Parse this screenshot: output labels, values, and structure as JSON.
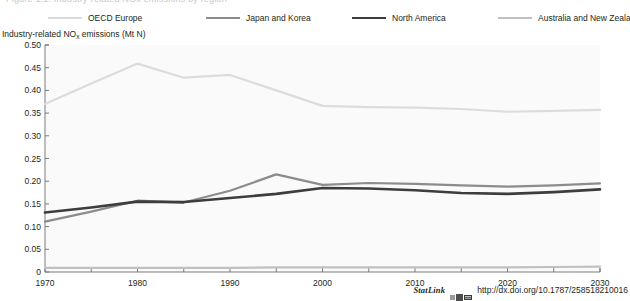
{
  "figure": {
    "cutoff_text": "Figure 1.1. Industry-related NOx emissions by region",
    "y_axis_title_main": "Industry-related NO",
    "y_axis_title_sub": "x",
    "y_axis_title_rest": " emissions (Mt N)"
  },
  "legend": {
    "items": [
      {
        "label": "OECD Europe",
        "color": "#dcdcdc",
        "width": 2.2
      },
      {
        "label": "Japan and Korea",
        "color": "#8c8c8c",
        "width": 2.2
      },
      {
        "label": "North America",
        "color": "#3d3d3d",
        "width": 2.6
      },
      {
        "label": "Australia and New Zealand",
        "color": "#c0c0c0",
        "width": 2.2
      }
    ]
  },
  "statlink": {
    "word": "StatLink",
    "icon": "statlink-excel-icon",
    "url": "http://dx.doi.org/10.1787/258518210016"
  },
  "colors": {
    "axis": "#6d6d6d",
    "plot_background": "#fafafa",
    "text": "#231f20"
  },
  "chart_data": {
    "type": "line",
    "title": "",
    "xlabel": "",
    "ylabel": "Industry-related NOx emissions (Mt N)",
    "xlim": [
      1970,
      2030
    ],
    "ylim": [
      0,
      0.5
    ],
    "grid": false,
    "legend_position": "top",
    "xticks": [
      1970,
      1980,
      1990,
      2000,
      2010,
      2020,
      2030
    ],
    "xtick_labels": [
      "1970",
      "1980",
      "1990",
      "2000",
      "2010",
      "2020",
      "2030"
    ],
    "x_minor_ticks": [
      1975,
      1985,
      1995,
      2005,
      2015,
      2025
    ],
    "yticks": [
      0,
      0.05,
      0.1,
      0.15,
      0.2,
      0.25,
      0.3,
      0.35,
      0.4,
      0.45,
      0.5
    ],
    "ytick_labels": [
      "0",
      "0.05",
      "0.10",
      "0.15",
      "0.20",
      "0.25",
      "0.30",
      "0.35",
      "0.40",
      "0.45",
      "0.50"
    ],
    "x": [
      1970,
      1975,
      1980,
      1985,
      1990,
      1995,
      2000,
      2005,
      2010,
      2015,
      2020,
      2025,
      2030
    ],
    "series": [
      {
        "name": "OECD Europe",
        "color": "#dcdcdc",
        "width": 2.2,
        "values": [
          0.37,
          0.415,
          0.459,
          0.428,
          0.434,
          0.4,
          0.366,
          0.363,
          0.362,
          0.359,
          0.353,
          0.355,
          0.357
        ]
      },
      {
        "name": "Japan and Korea",
        "color": "#8c8c8c",
        "width": 2.2,
        "values": [
          0.111,
          0.133,
          0.157,
          0.153,
          0.179,
          0.215,
          0.192,
          0.196,
          0.194,
          0.191,
          0.188,
          0.191,
          0.195
        ]
      },
      {
        "name": "North America",
        "color": "#3d3d3d",
        "width": 2.6,
        "values": [
          0.131,
          0.142,
          0.155,
          0.154,
          0.163,
          0.172,
          0.185,
          0.184,
          0.18,
          0.174,
          0.172,
          0.176,
          0.182
        ]
      },
      {
        "name": "Australia and New Zealand",
        "color": "#c0c0c0",
        "width": 2.2,
        "values": [
          0.009,
          0.009,
          0.009,
          0.009,
          0.009,
          0.01,
          0.01,
          0.01,
          0.01,
          0.01,
          0.01,
          0.011,
          0.012
        ]
      }
    ]
  }
}
